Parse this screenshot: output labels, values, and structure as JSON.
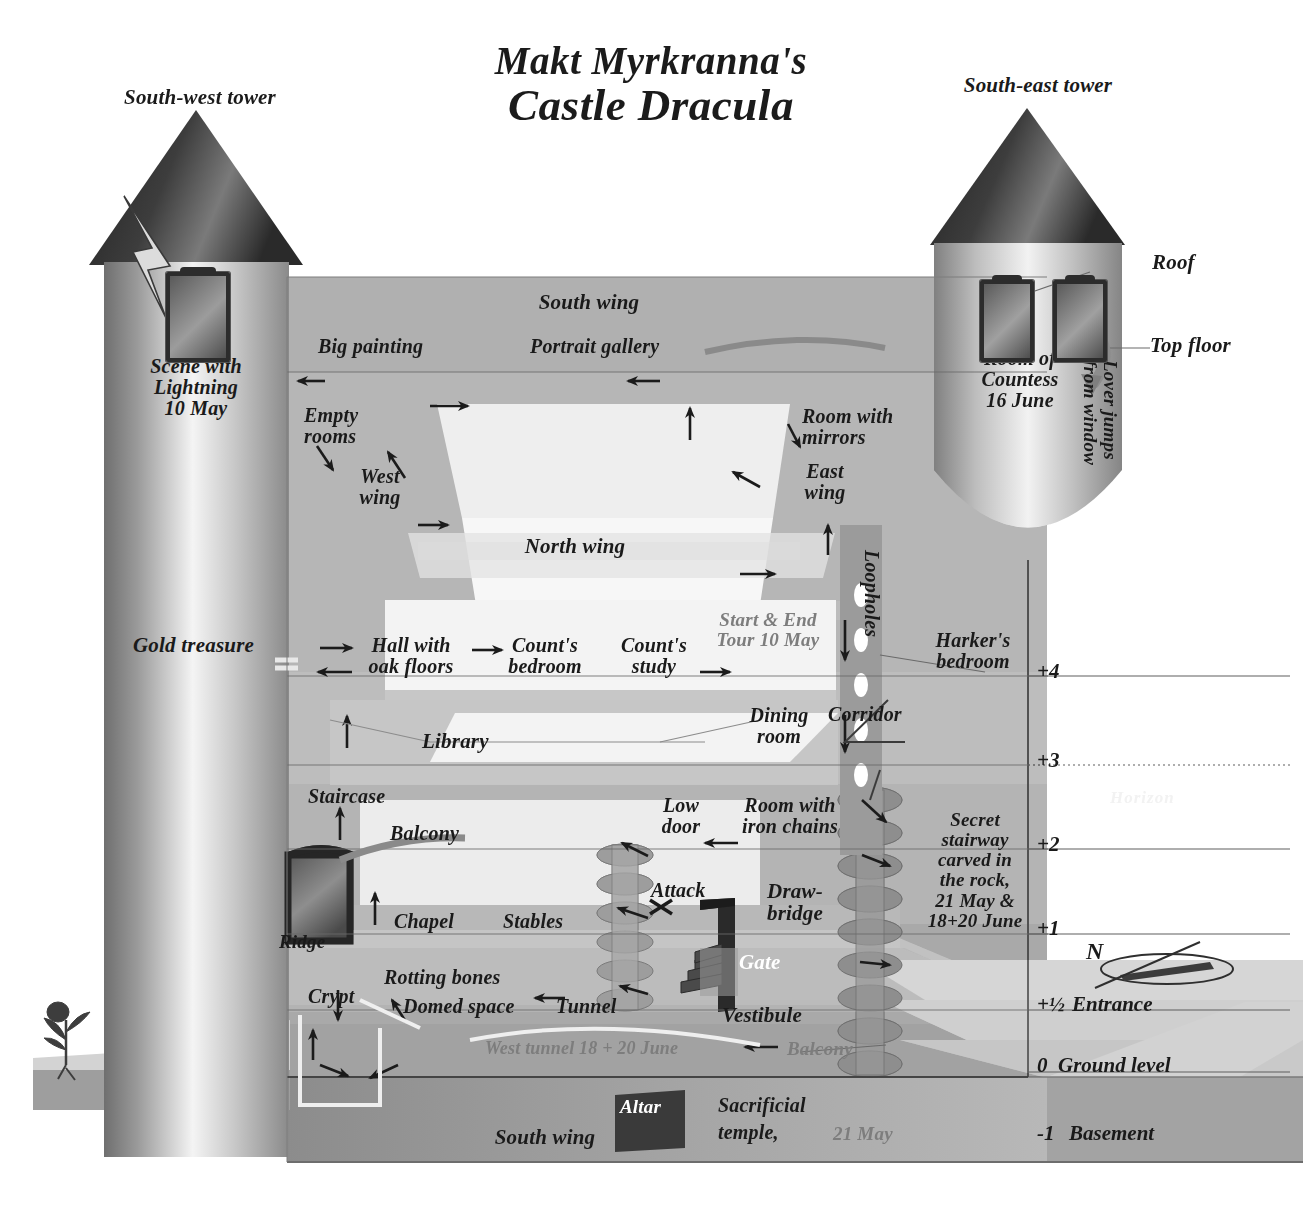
{
  "title": {
    "line1": "Makt Myrkranna's",
    "line2": "Castle Dracula"
  },
  "towers": {
    "southwest": {
      "label": "South-west tower",
      "room_label": "Scene with\nLightning\n10 May",
      "icon": "lightning-bolt"
    },
    "southeast": {
      "label": "South-east tower",
      "room_label": "Room of\nCountess\n16 June",
      "roof_label": "Roof",
      "top_floor_label": "Top floor",
      "lover_label": "Lover jumps\nfrom window"
    }
  },
  "wings": {
    "south_top": "South wing",
    "south_bottom": "South wing",
    "north": "North wing",
    "west": "West\nwing",
    "east": "East\nwing"
  },
  "rooms": [
    {
      "id": "big-painting",
      "text": "Big painting"
    },
    {
      "id": "portrait-gallery",
      "text": "Portrait gallery"
    },
    {
      "id": "empty-rooms",
      "text": "Empty\nrooms"
    },
    {
      "id": "room-mirrors",
      "text": "Room with\nmirrors"
    },
    {
      "id": "gold-treasure",
      "text": "Gold treasure"
    },
    {
      "id": "hall-oak-floors",
      "text": "Hall with\noak floors"
    },
    {
      "id": "counts-bedroom",
      "text": "Count's\nbedroom"
    },
    {
      "id": "counts-study",
      "text": "Count's\nstudy"
    },
    {
      "id": "start-end-tour",
      "text": "Start & End\nTour 10 May"
    },
    {
      "id": "harkers-bedroom",
      "text": "Harker's\nbedroom"
    },
    {
      "id": "loopholes",
      "text": "Loopholes"
    },
    {
      "id": "library",
      "text": "Library"
    },
    {
      "id": "dining-room",
      "text": "Dining\nroom"
    },
    {
      "id": "corridor",
      "text": "Corridor"
    },
    {
      "id": "staircase",
      "text": "Staircase"
    },
    {
      "id": "balcony-upper",
      "text": "Balcony"
    },
    {
      "id": "low-door",
      "text": "Low\ndoor"
    },
    {
      "id": "room-iron-chains",
      "text": "Room with\niron chains"
    },
    {
      "id": "secret-stairway",
      "text": "Secret\nstairway\ncarved in\nthe rock,\n21 May &\n18+20 June"
    },
    {
      "id": "chapel",
      "text": "Chapel"
    },
    {
      "id": "stables",
      "text": "Stables"
    },
    {
      "id": "attack",
      "text": "Attack"
    },
    {
      "id": "drawbridge",
      "text": "Draw-\nbridge"
    },
    {
      "id": "ridge",
      "text": "Ridge"
    },
    {
      "id": "gate",
      "text": "Gate"
    },
    {
      "id": "crypt",
      "text": "Crypt"
    },
    {
      "id": "rotting-bones",
      "text": "Rotting bones"
    },
    {
      "id": "domed-space",
      "text": "Domed space"
    },
    {
      "id": "tunnel",
      "text": "Tunnel"
    },
    {
      "id": "vestibule",
      "text": "Vestibule"
    },
    {
      "id": "west-tunnel",
      "text": "West tunnel 18 + 20 June"
    },
    {
      "id": "balcony-lower",
      "text": "Balcony"
    },
    {
      "id": "altar",
      "text": "Altar"
    },
    {
      "id": "sacrificial-temple",
      "text": "Sacrificial"
    },
    {
      "id": "sacrificial-temple-2",
      "text": "temple,"
    },
    {
      "id": "sacrificial-date",
      "text": "21 May"
    }
  ],
  "levels": [
    {
      "num": "+4",
      "name": ""
    },
    {
      "num": "+3",
      "name": ""
    },
    {
      "num": "+2",
      "name": ""
    },
    {
      "num": "+1",
      "name": ""
    },
    {
      "num": "+½",
      "name": "Entrance"
    },
    {
      "num": "0",
      "name": "Ground level"
    },
    {
      "num": "-1",
      "name": "Basement"
    }
  ],
  "annotations": {
    "horizon": "Horizon",
    "compass_north": "N"
  },
  "colors": {
    "ink": "#1a1a1a",
    "paper": "#ffffff",
    "wall_mid": "#b3b3b3",
    "wall_light": "#d8d8d8",
    "wall_dark": "#8f8f8f",
    "basement": "#9a9a9a",
    "roof_dark": "#3a3a3a"
  }
}
